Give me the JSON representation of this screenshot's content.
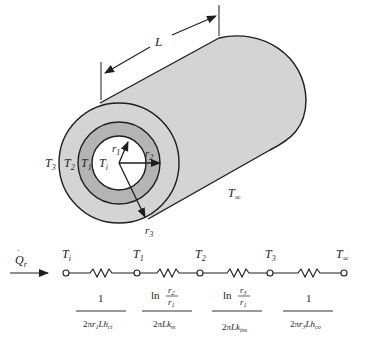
{
  "figure": {
    "length_label": "L",
    "cylinder": {
      "temperatures": {
        "outer_surface": "T3",
        "interface_2": "T2",
        "interface_1": "T1",
        "inner": "Ti",
        "ambient": "T∞"
      },
      "radii": {
        "r1": "r1",
        "r2": "r2",
        "r3": "r3"
      },
      "colors": {
        "outer_layer": "#d4d4d4",
        "middle_layer": "#b4b4b4",
        "core": "#ffffff",
        "outline": "#1e1e1e"
      }
    },
    "circuit": {
      "heat_flow_label": "Q̇r",
      "nodes": [
        "Ti",
        "T1",
        "T2",
        "T3",
        "T∞"
      ],
      "resistances": [
        {
          "numerator": "1",
          "denominator": "2πr1Lhci"
        },
        {
          "numerator": "ln r2/r1",
          "denominator": "2πLkm"
        },
        {
          "numerator": "ln r3/r1",
          "denominator": "2πLkins"
        },
        {
          "numerator": "1",
          "denominator": "2πr3Lhco"
        }
      ]
    }
  }
}
